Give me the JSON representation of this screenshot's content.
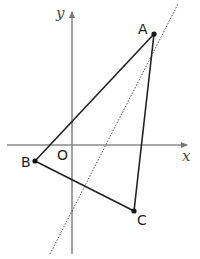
{
  "diagram": {
    "axes": {
      "x_label": "x",
      "y_label": "y",
      "origin_label": "O",
      "color": "#8a8a8a"
    },
    "points": [
      {
        "label": "A",
        "px": 154,
        "py": 34
      },
      {
        "label": "B",
        "px": 35,
        "py": 161
      },
      {
        "label": "C",
        "px": 134,
        "py": 211
      }
    ],
    "triangle": {
      "vertices": [
        "A",
        "B",
        "C"
      ],
      "color": "#222222"
    },
    "dotted_line": {
      "style": "dotted",
      "color": "#555555"
    }
  }
}
